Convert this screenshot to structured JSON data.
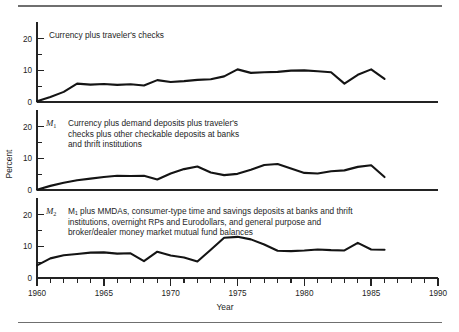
{
  "figure": {
    "has_top_rule": true,
    "has_bottom_rule": true,
    "rule_color": "#6f6f6f",
    "line_color": "#141414",
    "axis_color": "#232323",
    "background": "#ffffff"
  },
  "axes": {
    "y_axis_title": "Percent",
    "x_axis_title": "Year",
    "y_ticks_major": [
      "0",
      "10",
      "20"
    ],
    "y_ticks_minor": [
      "5",
      "15"
    ],
    "y_limits": [
      0,
      24
    ],
    "x_ticks_major": [
      "1960",
      "1965",
      "1970",
      "1975",
      "1980",
      "1985",
      "1990"
    ],
    "x_limits": [
      1960,
      1990
    ],
    "x_tick_interval_minor": 1,
    "x_tick_interval_major": 5,
    "grid": "off",
    "legend": "none"
  },
  "panels": [
    {
      "id": "panel-currency",
      "symbol": "",
      "symbol_subscript": "",
      "note_lines": [
        "Currency plus traveler's checks"
      ]
    },
    {
      "id": "panel-m1",
      "symbol": "M",
      "symbol_subscript": "1",
      "note_lines": [
        "Currency plus demand deposits plus traveler's",
        "checks plus other checkable deposits at banks",
        "and thrift institutions"
      ]
    },
    {
      "id": "panel-m2",
      "symbol": "M",
      "symbol_subscript": "2",
      "note_lines": [
        "M₁ plus MMDAs, consumer-type time and savings deposits at banks and thrift",
        "institutions, overnight RPs and Eurodollars, and general purpose and",
        "broker/dealer  money market mutual fund balances"
      ]
    }
  ],
  "chart_data": {
    "type": "line",
    "title": "",
    "subtitle": "",
    "xlabel": "Year",
    "ylabel": "Percent",
    "xlim": [
      1960,
      1990
    ],
    "ylim": [
      0,
      24
    ],
    "grid": "off",
    "legend_position": "none",
    "panel_layout": "three stacked panels sharing the Year axis",
    "panels": [
      {
        "name": "Currency plus traveler's checks",
        "ylim": [
          0,
          24
        ],
        "yticks": [
          0,
          5,
          10,
          15,
          20
        ],
        "x": [
          1960,
          1961,
          1962,
          1963,
          1964,
          1965,
          1966,
          1967,
          1968,
          1969,
          1970,
          1971,
          1972,
          1973,
          1974,
          1975,
          1976,
          1977,
          1978,
          1979,
          1980,
          1981,
          1982,
          1983,
          1984,
          1985,
          1986
        ],
        "values": [
          0.2,
          1.6,
          3.2,
          5.8,
          5.5,
          5.7,
          5.4,
          5.6,
          5.2,
          6.9,
          6.3,
          6.6,
          7.0,
          7.2,
          8.1,
          10.3,
          9.2,
          9.4,
          9.5,
          9.9,
          10.0,
          9.7,
          9.4,
          5.8,
          8.6,
          10.3,
          7.3
        ]
      },
      {
        "name": "M1",
        "ylim": [
          0,
          24
        ],
        "yticks": [
          0,
          5,
          10,
          15,
          20
        ],
        "x": [
          1960,
          1961,
          1962,
          1963,
          1964,
          1965,
          1966,
          1967,
          1968,
          1969,
          1970,
          1971,
          1972,
          1973,
          1974,
          1975,
          1976,
          1977,
          1978,
          1979,
          1980,
          1981,
          1982,
          1983,
          1984,
          1985,
          1986
        ],
        "values": [
          0.1,
          1.3,
          2.3,
          3.1,
          3.6,
          4.1,
          4.5,
          4.4,
          4.5,
          3.3,
          5.2,
          6.6,
          7.4,
          5.5,
          4.7,
          5.1,
          6.4,
          7.9,
          8.2,
          6.8,
          5.4,
          5.2,
          5.9,
          6.2,
          7.3,
          7.8,
          4.1,
          11.4
        ]
      },
      {
        "name": "M2",
        "ylim": [
          0,
          24
        ],
        "yticks": [
          0,
          5,
          10,
          15,
          20
        ],
        "x": [
          1960,
          1961,
          1962,
          1963,
          1964,
          1965,
          1966,
          1967,
          1968,
          1969,
          1970,
          1971,
          1972,
          1973,
          1974,
          1975,
          1976,
          1977,
          1978,
          1979,
          1980,
          1981,
          1982,
          1983,
          1984,
          1985,
          1986
        ],
        "values": [
          4.0,
          6.2,
          7.2,
          7.6,
          8.0,
          8.1,
          7.7,
          7.8,
          5.3,
          8.3,
          7.1,
          6.5,
          5.2,
          8.9,
          12.7,
          13.0,
          12.2,
          10.6,
          8.6,
          8.5,
          8.7,
          9.0,
          8.8,
          8.7,
          11.1,
          9.0,
          8.9
        ]
      }
    ]
  }
}
